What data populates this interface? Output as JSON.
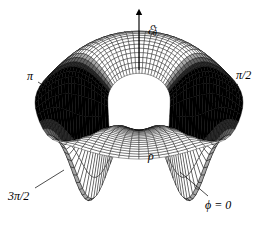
{
  "figure": {
    "kind": "3d-wireframe-surface-plot",
    "background_color": "#ffffff",
    "ink_color": "#000000",
    "width": 277,
    "height": 227
  },
  "labels": {
    "vertical_axis": "ℰ",
    "vertical_axis_sub": "θ",
    "vertical_axis_sup": "τ",
    "radial_axis": "ρ",
    "azimuth_pi": "π",
    "azimuth_pi_half": "π/2",
    "azimuth_3pi_half": "3π/2",
    "azimuth_zero": "ϕ = 0"
  },
  "chart_data": {
    "type": "surface",
    "title": "",
    "xlabel": "ρ",
    "ylabel": "ϕ",
    "zlabel": "ℰθτ",
    "coordinate_system": "cylindrical",
    "azimuth_ticks": [
      {
        "label": "ϕ = 0",
        "value": 0,
        "corner": "lower-right"
      },
      {
        "label": "π/2",
        "value": 1.5707963,
        "corner": "upper-right"
      },
      {
        "label": "π",
        "value": 3.1415927,
        "corner": "upper-left"
      },
      {
        "label": "3π/2",
        "value": 4.712389,
        "corner": "lower-left"
      }
    ],
    "grid": true,
    "legend": false,
    "mesh": {
      "radial_divisions": 22,
      "azimuth_divisions": 64,
      "rho_min": 0.3,
      "rho_max": 1.0
    },
    "surface_model": {
      "description": "Annular saddle-shaped radiation pattern with raised front rim, two deep downward nulls near the front, and dark dense side lobes at left and right.",
      "base_height": 0.3,
      "ridge_height": 1.0,
      "null_depth": -0.85,
      "null_azimuths_deg": [
        210,
        330
      ],
      "null_width_deg": 11,
      "ridge_azimuth_deg": 90,
      "lobe_azimuths_deg": [
        0,
        180
      ]
    },
    "projection": {
      "type": "oblique-axonometric",
      "elevation_deg": 22,
      "azimuth_deg": 270,
      "center_x": 139,
      "center_y": 132,
      "scale_x": 104,
      "scale_y": 40,
      "scale_z": 74
    }
  },
  "annotations": [
    {
      "name": "leader-pi",
      "from": [
        38,
        82
      ],
      "to": [
        62,
        97
      ]
    },
    {
      "name": "leader-pi-half",
      "from": [
        238,
        84
      ],
      "to": [
        212,
        104
      ]
    },
    {
      "name": "leader-3pi-half",
      "from": [
        35,
        188
      ],
      "to": [
        64,
        170
      ]
    },
    {
      "name": "leader-phi-zero",
      "from": [
        208,
        196
      ],
      "to": [
        180,
        172
      ]
    },
    {
      "name": "vertical-axis-arrow",
      "from": [
        139,
        70
      ],
      "to": [
        139,
        12
      ]
    }
  ]
}
